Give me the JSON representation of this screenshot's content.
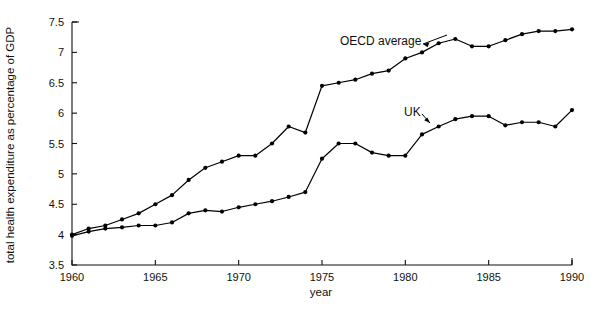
{
  "chart_data": {
    "type": "line",
    "title": "",
    "xlabel": "year",
    "ylabel": "total health expenditure as percentage of GDP",
    "xlim": [
      1960,
      1990
    ],
    "ylim": [
      3.5,
      7.5
    ],
    "xticks": [
      1960,
      1965,
      1970,
      1975,
      1980,
      1985,
      1990
    ],
    "xtick_labels": [
      "1960",
      "1965",
      "1970",
      "1975",
      "1980",
      "1985",
      "1990"
    ],
    "yticks": [
      3.5,
      4,
      4.5,
      5,
      5.5,
      6,
      6.5,
      7,
      7.5
    ],
    "ytick_labels": [
      "3.5",
      "4",
      "4.5",
      "5",
      "5.5",
      "6",
      "6.5",
      "7",
      "7.5"
    ],
    "grid": false,
    "legend_position": "inline-annotation",
    "markers": "filled-circle",
    "x": [
      1960,
      1961,
      1962,
      1963,
      1964,
      1965,
      1966,
      1967,
      1968,
      1969,
      1970,
      1971,
      1972,
      1973,
      1974,
      1975,
      1976,
      1977,
      1978,
      1979,
      1980,
      1981,
      1982,
      1983,
      1984,
      1985,
      1986,
      1987,
      1988,
      1989,
      1990
    ],
    "series": [
      {
        "name": "OECD average",
        "label": "OECD average",
        "color": "#000000",
        "values": [
          4.0,
          4.1,
          4.15,
          4.25,
          4.35,
          4.5,
          4.65,
          4.9,
          5.1,
          5.2,
          5.3,
          5.3,
          5.5,
          5.78,
          5.68,
          6.45,
          6.5,
          6.55,
          6.65,
          6.7,
          6.9,
          7.0,
          7.15,
          7.22,
          7.1,
          7.1,
          7.2,
          7.3,
          7.35,
          7.35,
          7.38
        ]
      },
      {
        "name": "UK",
        "label": "UK",
        "color": "#000000",
        "values": [
          3.98,
          4.05,
          4.1,
          4.12,
          4.15,
          4.15,
          4.2,
          4.35,
          4.4,
          4.38,
          4.45,
          4.5,
          4.55,
          4.62,
          4.7,
          5.25,
          5.5,
          5.5,
          5.35,
          5.3,
          5.3,
          5.65,
          5.78,
          5.9,
          5.95,
          5.95,
          5.8,
          5.85,
          5.85,
          5.78,
          6.05
        ]
      }
    ],
    "annotations": [
      {
        "text": "OECD average",
        "x_px": 340,
        "y_px": 45,
        "anchor": "start"
      },
      {
        "text": "UK",
        "x_px": 404,
        "y_px": 116,
        "anchor": "start"
      }
    ]
  }
}
